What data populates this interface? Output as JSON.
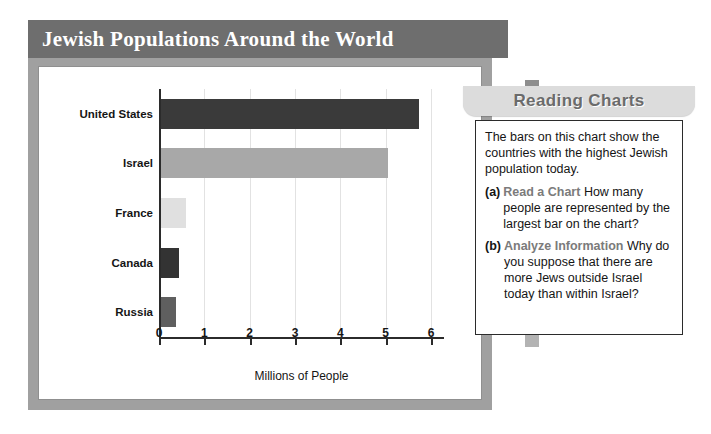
{
  "chart_card": {
    "title": "Jewish Populations Around the World"
  },
  "chart_data": {
    "type": "bar",
    "orientation": "horizontal",
    "title": "Jewish Populations Around the World",
    "categories": [
      "United States",
      "Israel",
      "France",
      "Canada",
      "Russia"
    ],
    "values": [
      5.7,
      5.0,
      0.55,
      0.39,
      0.33
    ],
    "bar_colors": [
      "#3a3a3a",
      "#a8a8a8",
      "#e0e0e0",
      "#333333",
      "#5f5f5f"
    ],
    "xlabel": "Millions of People",
    "ylabel": "",
    "xlim": [
      0,
      6
    ],
    "xticks": [
      0,
      1,
      2,
      3,
      4,
      5,
      6
    ],
    "xtick_labels": [
      "0",
      "1",
      "2",
      "3",
      "4",
      "5",
      "6"
    ],
    "grid": true,
    "legend": false
  },
  "sidebar": {
    "banner_title": "Reading Charts",
    "intro": "The bars on this chart show the countries with the highest Jewish population today.",
    "questions": [
      {
        "marker": "(a)",
        "lead": "Read a Chart",
        "text": "How many people are represented by the largest bar on the chart?"
      },
      {
        "marker": "(b)",
        "lead": "Analyze Information",
        "text": "Why do you suppose that there are more Jews outside Israel today than within Israel?"
      }
    ]
  }
}
